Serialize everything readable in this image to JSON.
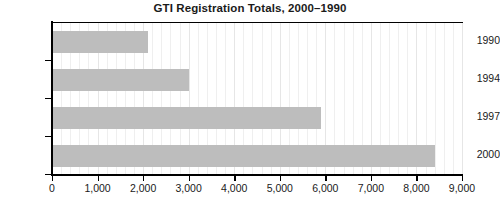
{
  "chart_data": {
    "type": "bar",
    "orientation": "horizontal",
    "title": "GTI Registration Totals, 2000–1990",
    "xlabel": "",
    "ylabel": "",
    "categories": [
      "1990",
      "1994",
      "1997",
      "2000"
    ],
    "values": [
      2100,
      3000,
      5900,
      8400
    ],
    "series": [
      {
        "name": "GTI Registrations",
        "values": [
          2100,
          3000,
          5900,
          8400
        ]
      }
    ],
    "xlim": [
      0,
      9000
    ],
    "xticks": [
      0,
      1000,
      2000,
      3000,
      4000,
      5000,
      6000,
      7000,
      8000,
      9000
    ],
    "xtick_labels": [
      "0",
      "1,000",
      "2,000",
      "3,000",
      "4,000",
      "5,000",
      "6,000",
      "7,000",
      "8,000",
      "9,000"
    ],
    "minor_tick_step": 200,
    "grid": "vertical-minor",
    "legend": "none",
    "bar_color": "#bdbdbd",
    "axis_color": "#000000",
    "gridline_color": "#efefef",
    "background_color": "#ffffff",
    "title_color": "#1a1a1a"
  }
}
